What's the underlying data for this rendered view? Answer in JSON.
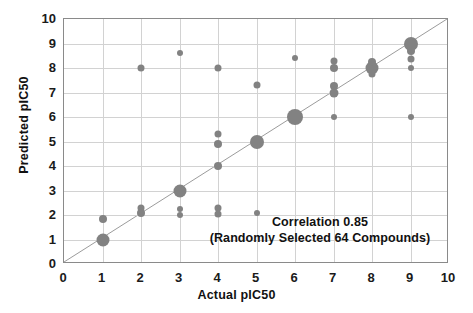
{
  "chart_data": {
    "type": "scatter",
    "title": "",
    "xlabel": "Actual pIC50",
    "ylabel": "Predicted pIC50",
    "xlim": [
      0,
      10
    ],
    "ylim": [
      0,
      10
    ],
    "xticks": [
      0,
      1,
      2,
      3,
      4,
      5,
      6,
      7,
      8,
      9,
      10
    ],
    "yticks": [
      0,
      1,
      2,
      3,
      4,
      5,
      6,
      7,
      8,
      9,
      10
    ],
    "grid": true,
    "legend": "none",
    "marker_color": "#828282",
    "reference_line": {
      "description": "y = x identity line",
      "from": [
        0,
        0
      ],
      "to": [
        10,
        10
      ],
      "color": "#9a9a9a"
    },
    "annotation_lines": [
      "Correlation 0.85",
      "(Randomly Selected 64 Compounds)"
    ],
    "correlation": 0.85,
    "n_compounds": 64,
    "note": "Marker size encodes number of overlapping compounds at that coordinate.",
    "points": [
      {
        "x": 1,
        "y": 1.0,
        "size": 13
      },
      {
        "x": 1,
        "y": 1.85,
        "size": 8
      },
      {
        "x": 2,
        "y": 2.3,
        "size": 7
      },
      {
        "x": 2,
        "y": 2.1,
        "size": 8
      },
      {
        "x": 2,
        "y": 8.0,
        "size": 7
      },
      {
        "x": 3,
        "y": 3.0,
        "size": 13
      },
      {
        "x": 3,
        "y": 2.25,
        "size": 6
      },
      {
        "x": 3,
        "y": 2.0,
        "size": 6
      },
      {
        "x": 3,
        "y": 8.6,
        "size": 6
      },
      {
        "x": 4,
        "y": 2.3,
        "size": 7
      },
      {
        "x": 4,
        "y": 2.05,
        "size": 7
      },
      {
        "x": 4,
        "y": 4.0,
        "size": 8
      },
      {
        "x": 4,
        "y": 4.9,
        "size": 8
      },
      {
        "x": 4,
        "y": 5.3,
        "size": 7
      },
      {
        "x": 4,
        "y": 8.0,
        "size": 7
      },
      {
        "x": 5,
        "y": 5.0,
        "size": 14
      },
      {
        "x": 5,
        "y": 7.3,
        "size": 7
      },
      {
        "x": 5,
        "y": 2.1,
        "size": 6
      },
      {
        "x": 6,
        "y": 6.0,
        "size": 16
      },
      {
        "x": 6,
        "y": 8.4,
        "size": 6
      },
      {
        "x": 7,
        "y": 6.0,
        "size": 6
      },
      {
        "x": 7,
        "y": 7.0,
        "size": 9
      },
      {
        "x": 7,
        "y": 7.25,
        "size": 8
      },
      {
        "x": 7,
        "y": 8.0,
        "size": 8
      },
      {
        "x": 7,
        "y": 8.3,
        "size": 7
      },
      {
        "x": 8,
        "y": 7.75,
        "size": 7
      },
      {
        "x": 8,
        "y": 8.0,
        "size": 13
      },
      {
        "x": 8,
        "y": 8.25,
        "size": 8
      },
      {
        "x": 9,
        "y": 6.0,
        "size": 6
      },
      {
        "x": 9,
        "y": 8.0,
        "size": 6
      },
      {
        "x": 9,
        "y": 8.35,
        "size": 7
      },
      {
        "x": 9,
        "y": 8.7,
        "size": 8
      },
      {
        "x": 9,
        "y": 9.0,
        "size": 14
      }
    ]
  }
}
